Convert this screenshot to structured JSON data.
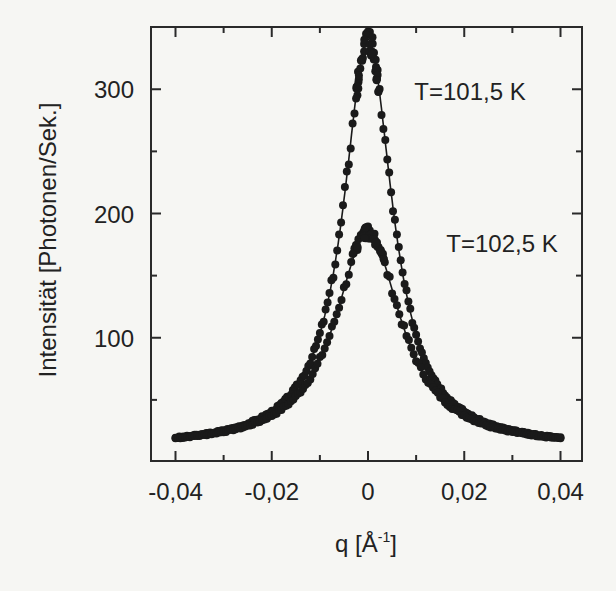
{
  "chart_data": {
    "type": "scatter",
    "title": "",
    "xlabel": "q [Å⁻¹]",
    "xlabel_base": "q [Å",
    "xlabel_sup": "-1",
    "xlabel_end": "]",
    "ylabel": "Intensität [Photonen/Sek.]",
    "xlim": [
      -0.045,
      0.045
    ],
    "ylim": [
      0,
      348
    ],
    "x_ticks": [
      -0.04,
      -0.02,
      0,
      0.02,
      0.04
    ],
    "x_tick_labels": [
      "-0,04",
      "-0,02",
      "0",
      "0,02",
      "0,04"
    ],
    "x_minor_ticks": [
      -0.03,
      -0.01,
      0.01,
      0.03
    ],
    "y_ticks": [
      100,
      200,
      300
    ],
    "y_tick_labels": [
      "100",
      "200",
      "300"
    ],
    "y_minor_ticks": [
      50,
      150,
      250
    ],
    "grid": false,
    "legend": "none (inline annotations)",
    "annotations": [
      {
        "text": "T=101,5 K",
        "x": 0.025,
        "y": 300
      },
      {
        "text": "T=102,5 K",
        "x": 0.025,
        "y": 145
      }
    ],
    "note": "Point values are approximate readings off the rendered curves. The underlying data were not visible, so the series are drawn from a Lorentzian-plus-background approximation whose parameters were estimated by eye from the peak height and half-maximum width.",
    "series": [
      {
        "name": "T=101,5 K",
        "marker": "filled circle",
        "fit_line": true,
        "model": "lorentzian (approximation)",
        "peak_center_approx": 0.0,
        "peak_height_approx": 340,
        "half_width_approx": 0.0062,
        "background_approx": 12,
        "x": [
          -0.04,
          -0.03,
          -0.02,
          -0.015,
          -0.01,
          -0.0075,
          -0.005,
          -0.0025,
          0,
          0.0025,
          0.005,
          0.0075,
          0.01,
          0.015,
          0.02,
          0.03,
          0.04
        ],
        "values": [
          20,
          25,
          39,
          54,
          98,
          137,
          196,
          287,
          340,
          287,
          196,
          137,
          98,
          54,
          39,
          25,
          20
        ]
      },
      {
        "name": "T=102,5 K",
        "marker": "filled circle",
        "fit_line": true,
        "model": "lorentzian (approximation)",
        "peak_center_approx": 0.0,
        "peak_height_approx": 185,
        "half_width_approx": 0.0083,
        "background_approx": 12,
        "x": [
          -0.04,
          -0.03,
          -0.02,
          -0.015,
          -0.01,
          -0.0075,
          -0.005,
          -0.0025,
          0,
          0.0025,
          0.005,
          0.0075,
          0.01,
          0.015,
          0.02,
          0.03,
          0.04
        ],
        "values": [
          20,
          26,
          40,
          52,
          80,
          104,
          130,
          163,
          185,
          163,
          130,
          104,
          80,
          52,
          40,
          26,
          20
        ]
      }
    ],
    "colors": {
      "data": "#1a1a1a",
      "axes": "#2a2a2a",
      "background": "#f6f6f3"
    }
  },
  "plot": {
    "annotation_1": "T=101,5 K",
    "annotation_2": "T=102,5 K"
  }
}
